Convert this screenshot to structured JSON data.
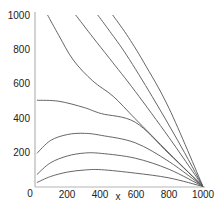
{
  "chart_data": {
    "type": "line",
    "title": "",
    "xlabel": "x",
    "ylabel": "",
    "xlim": [
      0,
      1000
    ],
    "ylim": [
      0,
      1000
    ],
    "grid": false,
    "legend": null,
    "x_ticks": [
      "0",
      "200",
      "400",
      "600",
      "800",
      "1000"
    ],
    "y_ticks": [
      "200",
      "400",
      "600",
      "800",
      "1000"
    ],
    "series": [
      {
        "name": "curve-1",
        "points": [
          [
            83,
            1000
          ],
          [
            150,
            880
          ],
          [
            235,
            737
          ],
          [
            350,
            615
          ],
          [
            470,
            526
          ],
          [
            600,
            395
          ],
          [
            800,
            195
          ],
          [
            1000,
            0
          ]
        ]
      },
      {
        "name": "curve-2",
        "points": [
          [
            249,
            1000
          ],
          [
            350,
            870
          ],
          [
            450,
            745
          ],
          [
            600,
            555
          ],
          [
            800,
            285
          ],
          [
            1000,
            0
          ]
        ]
      },
      {
        "name": "curve-3",
        "points": [
          [
            379,
            1000
          ],
          [
            450,
            905
          ],
          [
            550,
            765
          ],
          [
            700,
            525
          ],
          [
            850,
            270
          ],
          [
            1000,
            0
          ]
        ]
      },
      {
        "name": "curve-4",
        "points": [
          [
            467,
            1000
          ],
          [
            550,
            885
          ],
          [
            650,
            725
          ],
          [
            800,
            455
          ],
          [
            1000,
            0
          ]
        ]
      },
      {
        "name": "curve-5",
        "points": [
          [
            20,
            503
          ],
          [
            150,
            497
          ],
          [
            300,
            460
          ],
          [
            400,
            425
          ],
          [
            600,
            375
          ],
          [
            800,
            190
          ],
          [
            1000,
            0
          ]
        ]
      },
      {
        "name": "curve-6",
        "points": [
          [
            20,
            193
          ],
          [
            100,
            268
          ],
          [
            200,
            303
          ],
          [
            300,
            310
          ],
          [
            400,
            298
          ],
          [
            600,
            255
          ],
          [
            800,
            145
          ],
          [
            1000,
            0
          ]
        ]
      },
      {
        "name": "curve-7",
        "points": [
          [
            20,
            70
          ],
          [
            100,
            138
          ],
          [
            200,
            178
          ],
          [
            300,
            195
          ],
          [
            400,
            193
          ],
          [
            600,
            165
          ],
          [
            800,
            100
          ],
          [
            1000,
            0
          ]
        ]
      },
      {
        "name": "curve-8",
        "points": [
          [
            20,
            23
          ],
          [
            100,
            58
          ],
          [
            200,
            84
          ],
          [
            300,
            96
          ],
          [
            400,
            98
          ],
          [
            600,
            78
          ],
          [
            800,
            50
          ],
          [
            1000,
            0
          ]
        ]
      }
    ],
    "convergence_point": [
      1000,
      0
    ]
  },
  "axes": {
    "x_label": "x",
    "origin_label": "0"
  }
}
